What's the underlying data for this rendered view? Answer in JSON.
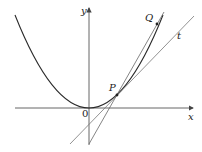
{
  "diagram": {
    "labels": {
      "x_axis": "x",
      "y_axis": "y",
      "origin": "0",
      "point_p": "P",
      "point_q": "Q",
      "tangent": "t"
    },
    "colors": {
      "curve": "#2a2a2a",
      "axes": "#555555",
      "lines": "#666666"
    }
  }
}
